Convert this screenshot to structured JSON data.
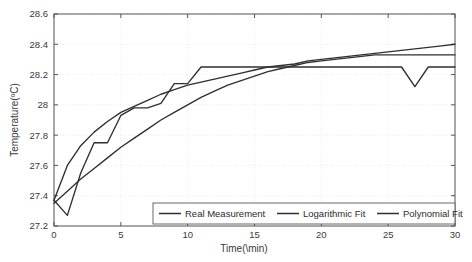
{
  "chart_data": {
    "type": "line",
    "title": "",
    "xlabel": "Time(\\min)",
    "ylabel": "Temperature(ºC)",
    "xlim": [
      0,
      30
    ],
    "ylim": [
      27.2,
      28.6
    ],
    "xticks": [
      0,
      5,
      10,
      15,
      20,
      25,
      30
    ],
    "xtick_labels": [
      "0",
      "5",
      "10",
      "15",
      "20",
      "25",
      "30"
    ],
    "yticks": [
      27.2,
      27.4,
      27.6,
      27.8,
      28.0,
      28.2,
      28.4,
      28.6
    ],
    "ytick_labels": [
      "27.2",
      "27.4",
      "27.6",
      "27.8",
      "28",
      "28.2",
      "28.4",
      "28.6"
    ],
    "grid": true,
    "legend_position": "lower center",
    "line_color": "#2f2f2f",
    "grid_color": "#e2e2e2",
    "axis_color": "#555555",
    "series": [
      {
        "name": "Real Measurement",
        "x": [
          0,
          1,
          2,
          3,
          4,
          5,
          6,
          7,
          8,
          9,
          10,
          11,
          12,
          13,
          14,
          15,
          16,
          17,
          18,
          19,
          20,
          21,
          22,
          23,
          24,
          25,
          26,
          27,
          28,
          29,
          30
        ],
        "values": [
          27.37,
          27.27,
          27.55,
          27.75,
          27.75,
          27.93,
          27.98,
          27.98,
          28.01,
          28.14,
          28.14,
          28.25,
          28.25,
          28.25,
          28.25,
          28.25,
          28.25,
          28.25,
          28.25,
          28.25,
          28.25,
          28.25,
          28.25,
          28.25,
          28.25,
          28.25,
          28.25,
          28.12,
          28.25,
          28.25,
          28.25
        ]
      },
      {
        "name": "Logarithmic Fit",
        "x": [
          0,
          1,
          2,
          3,
          4,
          5,
          6,
          7,
          8,
          9,
          10,
          11,
          12,
          13,
          14,
          15,
          16,
          17,
          18,
          19,
          20,
          21,
          22,
          23,
          24,
          25,
          26,
          27,
          28,
          29,
          30
        ],
        "values": [
          27.37,
          27.6,
          27.73,
          27.82,
          27.89,
          27.95,
          27.99,
          28.03,
          28.07,
          28.1,
          28.13,
          28.15,
          28.17,
          28.19,
          28.21,
          28.23,
          28.25,
          28.26,
          28.27,
          28.29,
          28.3,
          28.31,
          28.32,
          28.33,
          28.34,
          28.35,
          28.36,
          28.37,
          28.38,
          28.39,
          28.4
        ]
      },
      {
        "name": "Polynomial Fit",
        "x": [
          0,
          1,
          2,
          3,
          4,
          5,
          6,
          7,
          8,
          9,
          10,
          11,
          12,
          13,
          14,
          15,
          16,
          17,
          18,
          19,
          20,
          21,
          22,
          23,
          24,
          25,
          26,
          27,
          28,
          29,
          30
        ],
        "values": [
          27.35,
          27.43,
          27.51,
          27.58,
          27.65,
          27.72,
          27.78,
          27.84,
          27.9,
          27.95,
          28.0,
          28.05,
          28.09,
          28.13,
          28.16,
          28.19,
          28.22,
          28.24,
          28.26,
          28.28,
          28.29,
          28.3,
          28.31,
          28.32,
          28.33,
          28.33,
          28.33,
          28.33,
          28.33,
          28.33,
          28.33
        ]
      }
    ]
  },
  "legend": {
    "items": [
      {
        "label": "Real Measurement"
      },
      {
        "label": "Logarithmic Fit"
      },
      {
        "label": "Polynomial Fit"
      }
    ]
  }
}
